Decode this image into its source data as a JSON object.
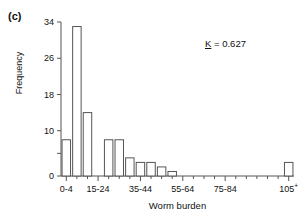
{
  "panel": {
    "label": "(c)"
  },
  "annotation": {
    "symbol": "K",
    "equals": " = ",
    "value": "0.627"
  },
  "chart_data": {
    "type": "bar",
    "title": "",
    "subtitle": "",
    "xlabel": "Worm burden",
    "ylabel": "Frequency",
    "ylim": [
      0,
      34
    ],
    "grid": false,
    "legend": null,
    "yticks": [
      0,
      10,
      18,
      26,
      34
    ],
    "ytick_labels": [
      "0",
      "10",
      "18",
      "26",
      "34"
    ],
    "minor_ytick": 5,
    "categories": [
      "0-4",
      "5-9",
      "10-14",
      "15-19",
      "20-24",
      "25-29",
      "30-34",
      "35-39",
      "40-44",
      "45-49",
      "50-54",
      "55-59",
      "60-64",
      "65-69",
      "70-74",
      "75-79",
      "80-84",
      "85-89",
      "90-94",
      "95-99",
      "100-104",
      "105+"
    ],
    "values": [
      8,
      33,
      14,
      0,
      8,
      8,
      4,
      3,
      3,
      2,
      1,
      0,
      0,
      0,
      0,
      0,
      0,
      0,
      0,
      0,
      0,
      3
    ],
    "labeled_xticks": [
      {
        "index": 0,
        "label": "0-4"
      },
      {
        "index": 3,
        "label": "15-24"
      },
      {
        "index": 7,
        "label": "35-44"
      },
      {
        "index": 11,
        "label": "55-64"
      },
      {
        "index": 15,
        "label": "75-84"
      },
      {
        "index": 21,
        "label": "105",
        "superscript": "+"
      }
    ],
    "bar_facecolor": "#ffffff",
    "bar_edgecolor": "#555555",
    "axis_color": "#555555"
  }
}
